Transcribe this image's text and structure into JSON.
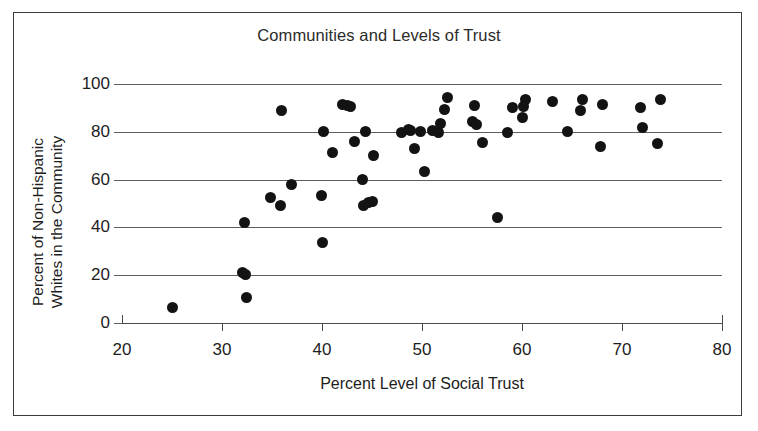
{
  "chart_data": {
    "type": "scatter",
    "title": "Communities and Levels of Trust",
    "xlabel": "Percent Level of Social Trust",
    "ylabel_line1": "Percent of Non-Hispanic",
    "ylabel_line2": "Whites in the Community",
    "xlim": [
      20,
      80
    ],
    "ylim": [
      0,
      100
    ],
    "xticks": [
      20,
      30,
      40,
      50,
      60,
      70,
      80
    ],
    "yticks": [
      0,
      20,
      40,
      60,
      80,
      100
    ],
    "grid": "horizontal",
    "legend": "none",
    "marker_color": "#131313",
    "grid_color": "#5e5e5e",
    "points": [
      {
        "x": 25.0,
        "y": 6.5
      },
      {
        "x": 32.0,
        "y": 21.0
      },
      {
        "x": 32.3,
        "y": 20.5
      },
      {
        "x": 32.4,
        "y": 10.5
      },
      {
        "x": 32.2,
        "y": 42.0
      },
      {
        "x": 34.8,
        "y": 52.5
      },
      {
        "x": 35.8,
        "y": 49.0
      },
      {
        "x": 35.9,
        "y": 89.0
      },
      {
        "x": 36.9,
        "y": 58.0
      },
      {
        "x": 39.9,
        "y": 53.5
      },
      {
        "x": 40.0,
        "y": 33.5
      },
      {
        "x": 40.1,
        "y": 80.0
      },
      {
        "x": 41.0,
        "y": 71.5
      },
      {
        "x": 42.0,
        "y": 91.5
      },
      {
        "x": 42.5,
        "y": 91.0
      },
      {
        "x": 42.8,
        "y": 90.5
      },
      {
        "x": 43.2,
        "y": 76.0
      },
      {
        "x": 44.0,
        "y": 60.0
      },
      {
        "x": 44.1,
        "y": 49.0
      },
      {
        "x": 44.3,
        "y": 80.0
      },
      {
        "x": 44.6,
        "y": 50.5
      },
      {
        "x": 45.0,
        "y": 51.0
      },
      {
        "x": 45.1,
        "y": 70.0
      },
      {
        "x": 47.9,
        "y": 79.5
      },
      {
        "x": 48.6,
        "y": 81.0
      },
      {
        "x": 48.8,
        "y": 80.5
      },
      {
        "x": 49.2,
        "y": 73.0
      },
      {
        "x": 49.8,
        "y": 80.0
      },
      {
        "x": 50.2,
        "y": 63.5
      },
      {
        "x": 51.0,
        "y": 80.5
      },
      {
        "x": 51.6,
        "y": 79.5
      },
      {
        "x": 51.8,
        "y": 83.5
      },
      {
        "x": 52.2,
        "y": 89.5
      },
      {
        "x": 52.5,
        "y": 94.5
      },
      {
        "x": 55.0,
        "y": 84.5
      },
      {
        "x": 55.2,
        "y": 91.0
      },
      {
        "x": 55.4,
        "y": 83.0
      },
      {
        "x": 56.0,
        "y": 75.5
      },
      {
        "x": 57.5,
        "y": 44.0
      },
      {
        "x": 58.5,
        "y": 79.5
      },
      {
        "x": 59.0,
        "y": 90.0
      },
      {
        "x": 60.0,
        "y": 86.0
      },
      {
        "x": 60.1,
        "y": 90.5
      },
      {
        "x": 60.3,
        "y": 93.5
      },
      {
        "x": 63.0,
        "y": 92.5
      },
      {
        "x": 64.5,
        "y": 80.0
      },
      {
        "x": 65.8,
        "y": 89.0
      },
      {
        "x": 66.0,
        "y": 93.5
      },
      {
        "x": 67.8,
        "y": 74.0
      },
      {
        "x": 68.0,
        "y": 91.5
      },
      {
        "x": 71.8,
        "y": 90.0
      },
      {
        "x": 72.0,
        "y": 82.0
      },
      {
        "x": 73.5,
        "y": 75.0
      },
      {
        "x": 73.8,
        "y": 93.5
      }
    ]
  }
}
